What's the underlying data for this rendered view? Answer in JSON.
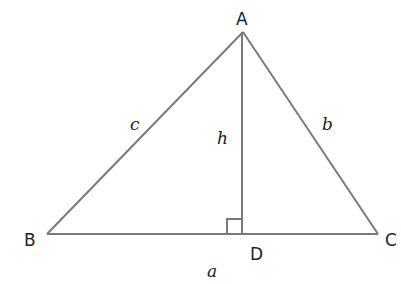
{
  "diagram": {
    "type": "triangle-altitude",
    "vertices": {
      "A": {
        "label": "A",
        "x": 243,
        "y": 32
      },
      "B": {
        "label": "B",
        "x": 47,
        "y": 234
      },
      "C": {
        "label": "C",
        "x": 378,
        "y": 234
      },
      "D": {
        "label": "D",
        "x": 242,
        "y": 234
      }
    },
    "sides": {
      "a": "a",
      "b": "b",
      "c": "c",
      "h": "h"
    },
    "right_angle_at": "D",
    "colors": {
      "line": "#7a7a7a",
      "text": "#222222"
    }
  }
}
